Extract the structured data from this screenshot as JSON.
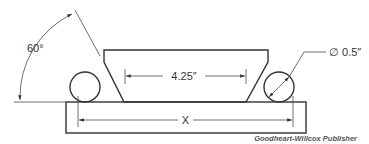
{
  "diagram": {
    "angle_label": "60°",
    "inner_distance_label": "4.25″",
    "roller_diameter_label": "∅ 0.5″",
    "outer_distance_label": "X",
    "credit": "Goodheart-Willcox Publisher",
    "colors": {
      "line": "#333333",
      "background": "#ffffff",
      "credit_text": "#555555"
    }
  }
}
